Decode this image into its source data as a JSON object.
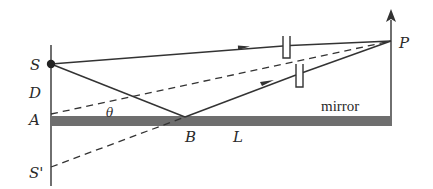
{
  "diagram": {
    "labels": {
      "source": "S",
      "image_source": "S'",
      "distance": "D",
      "point_a": "A",
      "point_b": "B",
      "length": "L",
      "point_p": "P",
      "angle": "θ",
      "mirror": "mirror"
    },
    "colors": {
      "line": "#333333",
      "mirror_fill": "#6e6e6e",
      "background": "#ffffff"
    },
    "points": {
      "S": [
        51,
        64
      ],
      "S_prime": [
        51,
        167
      ],
      "A": [
        51,
        114
      ],
      "B": [
        185,
        117
      ],
      "P": [
        391,
        41
      ]
    }
  }
}
